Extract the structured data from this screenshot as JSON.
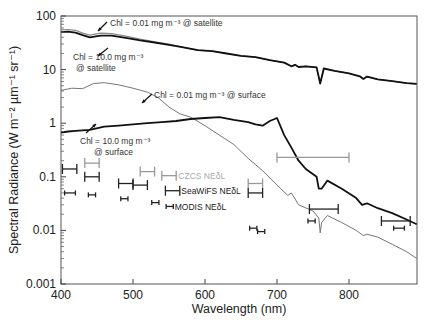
{
  "chart_data": {
    "type": "line",
    "title": "",
    "xlabel": "Wavelength (nm)",
    "ylabel": "Spectral Radiance (W m⁻² µm⁻¹ sr⁻¹)",
    "xlim": [
      400,
      894
    ],
    "ylim": [
      0.001,
      100
    ],
    "yscale": "log",
    "x_ticks": [
      400,
      500,
      600,
      700,
      800
    ],
    "y_ticks": [
      0.001,
      0.01,
      0.1,
      1,
      10,
      100
    ],
    "y_tick_labels": [
      "0.001",
      "0.01",
      "0.1",
      "1",
      "10",
      "100"
    ],
    "grid": false,
    "series": [
      {
        "name": "Chl = 0.01 mg m-3 @ satellite",
        "color": "#888888",
        "width": 1.2,
        "points": [
          [
            400,
            55
          ],
          [
            410,
            56
          ],
          [
            420,
            54
          ],
          [
            430,
            48
          ],
          [
            440,
            44
          ],
          [
            455,
            48
          ],
          [
            470,
            47
          ],
          [
            490,
            42
          ],
          [
            510,
            37
          ],
          [
            530,
            33
          ],
          [
            550,
            30
          ],
          [
            570,
            26
          ],
          [
            590,
            23
          ],
          [
            610,
            22
          ],
          [
            630,
            20
          ],
          [
            650,
            18
          ],
          [
            670,
            17
          ],
          [
            690,
            15
          ],
          [
            710,
            13.5
          ],
          [
            720,
            11.5
          ],
          [
            725,
            12.3
          ],
          [
            730,
            11.2
          ],
          [
            740,
            11.5
          ],
          [
            755,
            11
          ],
          [
            760,
            5.5
          ],
          [
            765,
            10.5
          ],
          [
            780,
            9.5
          ],
          [
            800,
            8.5
          ],
          [
            815,
            7.5
          ],
          [
            820,
            6.7
          ],
          [
            825,
            7.4
          ],
          [
            840,
            6.6
          ],
          [
            860,
            6.1
          ],
          [
            880,
            5.6
          ],
          [
            894,
            5.4
          ]
        ]
      },
      {
        "name": "Chl = 10.0 mg m-3 @ satellite",
        "color": "#111111",
        "width": 1.8,
        "points": [
          [
            400,
            50
          ],
          [
            410,
            51
          ],
          [
            420,
            49
          ],
          [
            430,
            44
          ],
          [
            440,
            40
          ],
          [
            455,
            43
          ],
          [
            470,
            43
          ],
          [
            490,
            39
          ],
          [
            510,
            35
          ],
          [
            530,
            32
          ],
          [
            550,
            29
          ],
          [
            570,
            26
          ],
          [
            590,
            23
          ],
          [
            610,
            22
          ],
          [
            630,
            20
          ],
          [
            650,
            18
          ],
          [
            670,
            17
          ],
          [
            690,
            15
          ],
          [
            710,
            13.5
          ],
          [
            720,
            11.5
          ],
          [
            725,
            12.3
          ],
          [
            730,
            11.2
          ],
          [
            740,
            11.5
          ],
          [
            755,
            11
          ],
          [
            760,
            5.5
          ],
          [
            765,
            10.5
          ],
          [
            780,
            9.5
          ],
          [
            800,
            8.5
          ],
          [
            815,
            7.5
          ],
          [
            820,
            6.7
          ],
          [
            825,
            7.4
          ],
          [
            840,
            6.6
          ],
          [
            860,
            6.1
          ],
          [
            880,
            5.6
          ],
          [
            894,
            5.4
          ]
        ]
      },
      {
        "name": "Chl = 0.01 mg m-3 @ surface",
        "color": "#777777",
        "width": 1,
        "points": [
          [
            400,
            4.1
          ],
          [
            415,
            4.5
          ],
          [
            430,
            4.4
          ],
          [
            445,
            5.5
          ],
          [
            460,
            5.7
          ],
          [
            480,
            5.2
          ],
          [
            500,
            4.5
          ],
          [
            520,
            3.8
          ],
          [
            535,
            3.0
          ],
          [
            550,
            2.0
          ],
          [
            565,
            1.5
          ],
          [
            580,
            1.3
          ],
          [
            600,
            0.9
          ],
          [
            620,
            0.6
          ],
          [
            640,
            0.4
          ],
          [
            660,
            0.22
          ],
          [
            680,
            0.13
          ],
          [
            700,
            0.07
          ],
          [
            715,
            0.045
          ],
          [
            720,
            0.05
          ],
          [
            730,
            0.03
          ],
          [
            750,
            0.023
          ],
          [
            758,
            0.017
          ],
          [
            760,
            0.009
          ],
          [
            762,
            0.014
          ],
          [
            770,
            0.019
          ],
          [
            790,
            0.014
          ],
          [
            810,
            0.01
          ],
          [
            820,
            0.008
          ],
          [
            825,
            0.0085
          ],
          [
            840,
            0.0075
          ],
          [
            860,
            0.0055
          ],
          [
            880,
            0.004
          ],
          [
            894,
            0.003
          ]
        ]
      },
      {
        "name": "Chl = 10.0 mg m-3 @ surface",
        "color": "#111111",
        "width": 1.8,
        "points": [
          [
            400,
            0.67
          ],
          [
            410,
            0.7
          ],
          [
            420,
            0.72
          ],
          [
            440,
            0.75
          ],
          [
            460,
            0.86
          ],
          [
            480,
            0.9
          ],
          [
            500,
            0.95
          ],
          [
            520,
            1.0
          ],
          [
            540,
            1.05
          ],
          [
            560,
            1.1
          ],
          [
            580,
            1.2
          ],
          [
            600,
            1.25
          ],
          [
            620,
            1.3
          ],
          [
            640,
            1.15
          ],
          [
            660,
            1.05
          ],
          [
            670,
            0.95
          ],
          [
            680,
            0.9
          ],
          [
            690,
            1.1
          ],
          [
            700,
            1.25
          ],
          [
            710,
            0.6
          ],
          [
            720,
            0.35
          ],
          [
            730,
            0.2
          ],
          [
            740,
            0.14
          ],
          [
            755,
            0.1
          ],
          [
            758,
            0.06
          ],
          [
            762,
            0.06
          ],
          [
            770,
            0.085
          ],
          [
            790,
            0.06
          ],
          [
            810,
            0.04
          ],
          [
            818,
            0.03
          ],
          [
            825,
            0.032
          ],
          [
            840,
            0.026
          ],
          [
            860,
            0.021
          ],
          [
            880,
            0.016
          ],
          [
            894,
            0.013
          ]
        ]
      }
    ],
    "error_bars": {
      "CZCS": {
        "label": "CZCS NEδL",
        "color": "#999999",
        "bars": [
          [
            443,
            433,
            453,
            0.18
          ],
          [
            520,
            510,
            530,
            0.125
          ],
          [
            550,
            540,
            560,
            0.105
          ],
          [
            670,
            660,
            680,
            0.075
          ],
          [
            750,
            700,
            800,
            0.23
          ]
        ]
      },
      "SeaWiFS": {
        "label": "SeaWiFS NEδL",
        "color": "#222222",
        "bars": [
          [
            412,
            402,
            422,
            0.14
          ],
          [
            443,
            433,
            453,
            0.1
          ],
          [
            490,
            480,
            500,
            0.075
          ],
          [
            510,
            500,
            520,
            0.07
          ],
          [
            555,
            545,
            565,
            0.055
          ],
          [
            670,
            660,
            680,
            0.05
          ],
          [
            765,
            745,
            785,
            0.025
          ],
          [
            865,
            845,
            885,
            0.015
          ]
        ]
      },
      "MODIS": {
        "label": "MODIS NEδL",
        "color": "#222222",
        "bars": [
          [
            412,
            405,
            420,
            0.05
          ],
          [
            443,
            438,
            448,
            0.046
          ],
          [
            488,
            483,
            493,
            0.039
          ],
          [
            531,
            526,
            536,
            0.033
          ],
          [
            551,
            546,
            556,
            0.028
          ],
          [
            667,
            662,
            672,
            0.011
          ],
          [
            678,
            673,
            683,
            0.0095
          ],
          [
            748,
            743,
            753,
            0.015
          ],
          [
            869,
            862,
            877,
            0.011
          ]
        ]
      }
    },
    "annotations": [
      {
        "text": "Chl = 0.01 mg m⁻³ @ satellite",
        "x": 110,
        "y": 26
      },
      {
        "text": "Chl = 10.0 mg m⁻³",
        "x": 73,
        "y": 60
      },
      {
        "text": "@ satellite",
        "x": 76,
        "y": 71
      },
      {
        "text": "Chl = 0.01 mg m⁻³ @ surface",
        "x": 154,
        "y": 98
      },
      {
        "text": "Chl = 10.0 mg m⁻³",
        "x": 80,
        "y": 144
      },
      {
        "text": "@ surface",
        "x": 94,
        "y": 155
      }
    ]
  }
}
